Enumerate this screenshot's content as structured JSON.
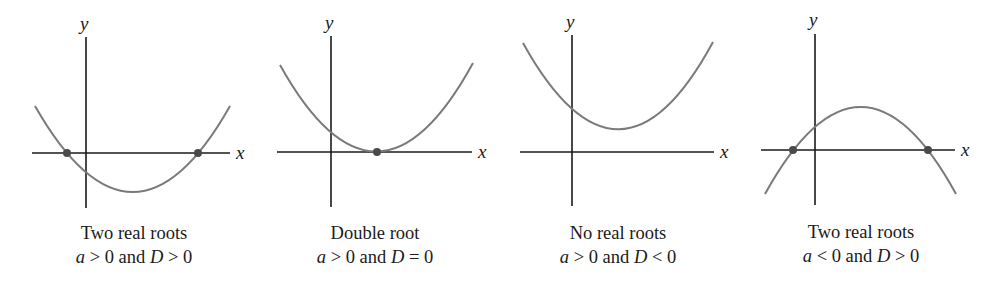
{
  "figure": {
    "panels": [
      {
        "title": "Two real roots",
        "condition_a": "a",
        "condition_a_rel": " > 0 and ",
        "condition_d": "D",
        "condition_d_rel": " > 0",
        "x_label": "x",
        "y_label": "y",
        "roots": 2,
        "opens": "up"
      },
      {
        "title": "Double root",
        "condition_a": "a",
        "condition_a_rel": " > 0 and ",
        "condition_d": "D",
        "condition_d_rel": " = 0",
        "x_label": "x",
        "y_label": "y",
        "roots": 1,
        "opens": "up"
      },
      {
        "title": "No real roots",
        "condition_a": "a",
        "condition_a_rel": " > 0 and ",
        "condition_d": "D",
        "condition_d_rel": " < 0",
        "x_label": "x",
        "y_label": "y",
        "roots": 0,
        "opens": "up"
      },
      {
        "title": "Two real roots",
        "condition_a": "a",
        "condition_a_rel": " < 0 and ",
        "condition_d": "D",
        "condition_d_rel": " > 0",
        "x_label": "x",
        "y_label": "y",
        "roots": 2,
        "opens": "down"
      }
    ],
    "colors": {
      "axis": "#1a1a1a",
      "curve": "#7a7a7a",
      "root_marker": "#4a4a4a"
    }
  }
}
